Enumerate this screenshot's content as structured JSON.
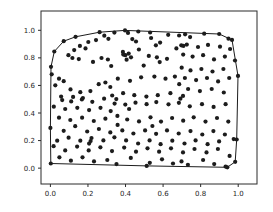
{
  "figure": {
    "background_color": "#ffffff",
    "axes_background_color": "#ffffff",
    "spine_color": "#2b2b2b",
    "tick_color": "#2b2b2b"
  },
  "chart_data": {
    "type": "scatter",
    "title": "",
    "xlabel": "",
    "ylabel": "",
    "grid": false,
    "legend": null,
    "xlim": [
      -0.05,
      1.1
    ],
    "ylim": [
      -0.115,
      1.14
    ],
    "x_ticks": [
      "0.0",
      "0.2",
      "0.4",
      "0.6",
      "0.8",
      "1.0"
    ],
    "y_ticks": [
      "0.0",
      "0.2",
      "0.4",
      "0.6",
      "0.8",
      "1.0"
    ],
    "marker": {
      "shape": "circle",
      "color": "#1c1c1c",
      "radius_px": 2.1
    },
    "hull": {
      "description": "convex hull outline drawn around the scatter points",
      "color": "#1c1c1c",
      "closed": true,
      "vertices": [
        [
          0.002,
          0.034
        ],
        [
          0.513,
          0.016
        ],
        [
          0.942,
          0.006
        ],
        [
          0.984,
          0.046
        ],
        [
          0.992,
          0.208
        ],
        [
          0.999,
          0.669
        ],
        [
          0.967,
          0.93
        ],
        [
          0.899,
          0.973
        ],
        [
          0.397,
          0.999
        ],
        [
          0.262,
          0.986
        ],
        [
          0.134,
          0.953
        ],
        [
          0.071,
          0.921
        ],
        [
          0.021,
          0.846
        ],
        [
          0.003,
          0.735
        ],
        [
          0.0,
          0.292
        ]
      ]
    },
    "points": [
      [
        0.002,
        0.034
      ],
      [
        0.513,
        0.016
      ],
      [
        0.942,
        0.006
      ],
      [
        0.984,
        0.046
      ],
      [
        0.992,
        0.208
      ],
      [
        0.999,
        0.669
      ],
      [
        0.967,
        0.93
      ],
      [
        0.899,
        0.973
      ],
      [
        0.397,
        0.999
      ],
      [
        0.262,
        0.986
      ],
      [
        0.134,
        0.953
      ],
      [
        0.071,
        0.921
      ],
      [
        0.021,
        0.846
      ],
      [
        0.003,
        0.735
      ],
      [
        0.0,
        0.292
      ],
      [
        0.287,
        0.961
      ],
      [
        0.309,
        0.938
      ],
      [
        0.341,
        0.983
      ],
      [
        0.413,
        0.981
      ],
      [
        0.468,
        0.991
      ],
      [
        0.531,
        0.984
      ],
      [
        0.536,
        0.944
      ],
      [
        0.627,
        0.967
      ],
      [
        0.685,
        0.962
      ],
      [
        0.717,
        0.971
      ],
      [
        0.744,
        0.951
      ],
      [
        0.819,
        0.975
      ],
      [
        0.948,
        0.939
      ],
      [
        0.243,
        0.929
      ],
      [
        0.436,
        0.936
      ],
      [
        0.202,
        0.915
      ],
      [
        0.456,
        0.919
      ],
      [
        0.584,
        0.911
      ],
      [
        0.157,
        0.887
      ],
      [
        0.187,
        0.869
      ],
      [
        0.127,
        0.856
      ],
      [
        0.562,
        0.891
      ],
      [
        0.697,
        0.891
      ],
      [
        0.671,
        0.869
      ],
      [
        0.726,
        0.896
      ],
      [
        0.786,
        0.879
      ],
      [
        0.839,
        0.894
      ],
      [
        0.903,
        0.881
      ],
      [
        0.957,
        0.864
      ],
      [
        0.471,
        0.861
      ],
      [
        0.096,
        0.819
      ],
      [
        0.117,
        0.799
      ],
      [
        0.151,
        0.791
      ],
      [
        0.272,
        0.799
      ],
      [
        0.306,
        0.788
      ],
      [
        0.386,
        0.843
      ],
      [
        0.399,
        0.819
      ],
      [
        0.417,
        0.831
      ],
      [
        0.429,
        0.804
      ],
      [
        0.406,
        0.787
      ],
      [
        0.524,
        0.814
      ],
      [
        0.567,
        0.804
      ],
      [
        0.621,
        0.793
      ],
      [
        0.707,
        0.824
      ],
      [
        0.757,
        0.809
      ],
      [
        0.813,
        0.819
      ],
      [
        0.871,
        0.789
      ],
      [
        0.929,
        0.809
      ],
      [
        0.983,
        0.781
      ],
      [
        0.227,
        0.771
      ],
      [
        0.324,
        0.741
      ],
      [
        0.582,
        0.769
      ],
      [
        0.497,
        0.744
      ],
      [
        0.699,
        0.729
      ],
      [
        0.746,
        0.709
      ],
      [
        0.804,
        0.719
      ],
      [
        0.863,
        0.701
      ],
      [
        0.921,
        0.719
      ],
      [
        0.007,
        0.681
      ],
      [
        0.046,
        0.649
      ],
      [
        0.071,
        0.631
      ],
      [
        0.359,
        0.649
      ],
      [
        0.424,
        0.634
      ],
      [
        0.483,
        0.659
      ],
      [
        0.554,
        0.664
      ],
      [
        0.613,
        0.649
      ],
      [
        0.663,
        0.664
      ],
      [
        0.686,
        0.609
      ],
      [
        0.716,
        0.654
      ],
      [
        0.776,
        0.639
      ],
      [
        0.834,
        0.654
      ],
      [
        0.893,
        0.629
      ],
      [
        0.952,
        0.654
      ],
      [
        0.257,
        0.609
      ],
      [
        0.293,
        0.621
      ],
      [
        0.026,
        0.601
      ],
      [
        0.107,
        0.571
      ],
      [
        0.159,
        0.551
      ],
      [
        0.213,
        0.559
      ],
      [
        0.319,
        0.589
      ],
      [
        0.387,
        0.544
      ],
      [
        0.447,
        0.529
      ],
      [
        0.511,
        0.519
      ],
      [
        0.572,
        0.529
      ],
      [
        0.639,
        0.544
      ],
      [
        0.733,
        0.574
      ],
      [
        0.796,
        0.559
      ],
      [
        0.859,
        0.574
      ],
      [
        0.923,
        0.549
      ],
      [
        0.057,
        0.519
      ],
      [
        0.121,
        0.517
      ],
      [
        0.173,
        0.509
      ],
      [
        0.329,
        0.527
      ],
      [
        0.351,
        0.501
      ],
      [
        0.692,
        0.504
      ],
      [
        0.706,
        0.524
      ],
      [
        0.063,
        0.494
      ],
      [
        0.111,
        0.484
      ],
      [
        0.168,
        0.499
      ],
      [
        0.223,
        0.481
      ],
      [
        0.286,
        0.504
      ],
      [
        0.342,
        0.468
      ],
      [
        0.399,
        0.461
      ],
      [
        0.453,
        0.475
      ],
      [
        0.512,
        0.464
      ],
      [
        0.564,
        0.479
      ],
      [
        0.629,
        0.463
      ],
      [
        0.684,
        0.474
      ],
      [
        0.742,
        0.449
      ],
      [
        0.807,
        0.464
      ],
      [
        0.869,
        0.444
      ],
      [
        0.933,
        0.464
      ],
      [
        0.018,
        0.446
      ],
      [
        0.079,
        0.429
      ],
      [
        0.143,
        0.438
      ],
      [
        0.206,
        0.421
      ],
      [
        0.267,
        0.438
      ],
      [
        0.321,
        0.414
      ],
      [
        0.419,
        0.429
      ],
      [
        0.046,
        0.366
      ],
      [
        0.106,
        0.349
      ],
      [
        0.169,
        0.366
      ],
      [
        0.231,
        0.342
      ],
      [
        0.293,
        0.359
      ],
      [
        0.357,
        0.379
      ],
      [
        0.409,
        0.353
      ],
      [
        0.472,
        0.339
      ],
      [
        0.533,
        0.369
      ],
      [
        0.589,
        0.338
      ],
      [
        0.648,
        0.364
      ],
      [
        0.707,
        0.344
      ],
      [
        0.763,
        0.369
      ],
      [
        0.826,
        0.338
      ],
      [
        0.887,
        0.364
      ],
      [
        0.947,
        0.338
      ],
      [
        0.071,
        0.271
      ],
      [
        0.132,
        0.304
      ],
      [
        0.358,
        0.314
      ],
      [
        0.543,
        0.306
      ],
      [
        0.196,
        0.266
      ],
      [
        0.258,
        0.284
      ],
      [
        0.319,
        0.259
      ],
      [
        0.383,
        0.274
      ],
      [
        0.442,
        0.251
      ],
      [
        0.504,
        0.274
      ],
      [
        0.563,
        0.249
      ],
      [
        0.621,
        0.274
      ],
      [
        0.683,
        0.251
      ],
      [
        0.746,
        0.269
      ],
      [
        0.809,
        0.244
      ],
      [
        0.868,
        0.269
      ],
      [
        0.929,
        0.244
      ],
      [
        0.976,
        0.211
      ],
      [
        0.036,
        0.199
      ],
      [
        0.097,
        0.221
      ],
      [
        0.159,
        0.199
      ],
      [
        0.219,
        0.219
      ],
      [
        0.282,
        0.201
      ],
      [
        0.341,
        0.224
      ],
      [
        0.403,
        0.201
      ],
      [
        0.467,
        0.179
      ],
      [
        0.528,
        0.201
      ],
      [
        0.587,
        0.174
      ],
      [
        0.649,
        0.199
      ],
      [
        0.714,
        0.179
      ],
      [
        0.773,
        0.201
      ],
      [
        0.837,
        0.174
      ],
      [
        0.898,
        0.194
      ],
      [
        0.017,
        0.159
      ],
      [
        0.079,
        0.129
      ],
      [
        0.142,
        0.156
      ],
      [
        0.204,
        0.129
      ],
      [
        0.266,
        0.151
      ],
      [
        0.328,
        0.124
      ],
      [
        0.393,
        0.149
      ],
      [
        0.456,
        0.119
      ],
      [
        0.517,
        0.144
      ],
      [
        0.579,
        0.119
      ],
      [
        0.642,
        0.144
      ],
      [
        0.706,
        0.114
      ],
      [
        0.767,
        0.139
      ],
      [
        0.831,
        0.114
      ],
      [
        0.892,
        0.139
      ],
      [
        0.954,
        0.089
      ],
      [
        0.048,
        0.079
      ],
      [
        0.109,
        0.054
      ],
      [
        0.171,
        0.079
      ],
      [
        0.232,
        0.049
      ],
      [
        0.303,
        0.059
      ],
      [
        0.352,
        0.029
      ],
      [
        0.529,
        0.039
      ],
      [
        0.594,
        0.064
      ],
      [
        0.653,
        0.034
      ],
      [
        0.698,
        0.049
      ],
      [
        0.732,
        0.024
      ],
      [
        0.813,
        0.059
      ],
      [
        0.872,
        0.029
      ],
      [
        0.933,
        0.011
      ],
      [
        0.428,
        0.074
      ],
      [
        0.214,
        0.196
      ],
      [
        0.206,
        0.178
      ],
      [
        0.388,
        0.824
      ],
      [
        0.708,
        0.887
      ]
    ]
  }
}
